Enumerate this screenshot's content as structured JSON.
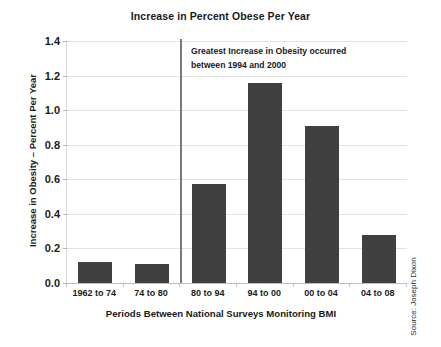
{
  "chart_data": {
    "type": "bar",
    "title": "Increase in Percent Obese Per Year",
    "xlabel": "Periods Between National Surveys Monitoring BMI",
    "ylabel": "Increase in Obesity – Percent Per Year",
    "categories": [
      "1962 to 74",
      "74 to 80",
      "80 to 94",
      "94 to 00",
      "00 to 04",
      "04 to 08"
    ],
    "values": [
      0.12,
      0.11,
      0.57,
      1.16,
      0.91,
      0.28
    ],
    "ylim": [
      0.0,
      1.4
    ],
    "ytick_labels": [
      "0.0",
      "0.2",
      "0.4",
      "0.6",
      "0.8",
      "1.0",
      "1.2",
      "1.4"
    ],
    "ytick_values": [
      0.0,
      0.2,
      0.4,
      0.6,
      0.8,
      1.0,
      1.2,
      1.4
    ],
    "grid": true,
    "legend": "none",
    "bar_color": "#404040",
    "gridline_color": "#e2e2e2",
    "annotations": [
      {
        "name": "greatest-increase-note",
        "line1": "Greatest Increase in Obesity occurred",
        "line2": "between 1994 and 2000",
        "divider_after_category": "74 to 80"
      }
    ],
    "source": "Source: Joseph Dixon"
  }
}
